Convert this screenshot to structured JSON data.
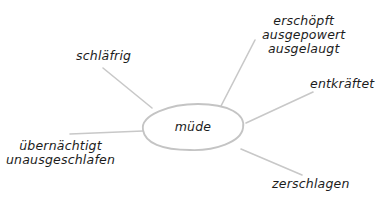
{
  "mindmap": {
    "center": {
      "label": "müde"
    },
    "branches": [
      {
        "id": "schlaefrig",
        "lines": [
          "schläfrig"
        ]
      },
      {
        "id": "erschoepft",
        "lines": [
          "erschöpft",
          "ausgepowert",
          "ausgelaugt"
        ]
      },
      {
        "id": "entkraeftet",
        "lines": [
          "entkräftet"
        ]
      },
      {
        "id": "uebernaechtigt",
        "lines": [
          "übernächtigt",
          "unausgeschlafen"
        ]
      },
      {
        "id": "zerschlagen",
        "lines": [
          "zerschlagen"
        ]
      }
    ],
    "colors": {
      "line": "#c8c8c8",
      "ellipse_stroke": "#c4c4c4",
      "text": "#1c1c1c",
      "background": "#ffffff"
    }
  }
}
